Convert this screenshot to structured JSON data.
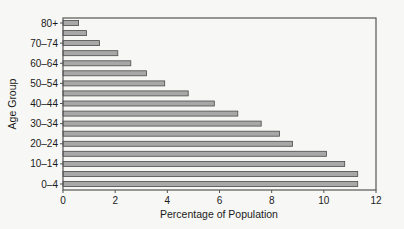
{
  "chart_data": {
    "type": "bar",
    "orientation": "horizontal",
    "title": "",
    "xlabel": "Percentage of Population",
    "ylabel": "Age Group",
    "xlim": [
      0,
      12
    ],
    "xticks": [
      0,
      2,
      4,
      6,
      8,
      10,
      12
    ],
    "grid": false,
    "legend": null,
    "categories": [
      "0–4",
      "5–9",
      "10–14",
      "15–19",
      "20–24",
      "25–29",
      "30–34",
      "35–39",
      "40–44",
      "45–49",
      "50–54",
      "55–59",
      "60–64",
      "65–69",
      "70–74",
      "75–79",
      "80+"
    ],
    "ytick_labels_shown": [
      "0–4",
      "10–14",
      "20–24",
      "30–34",
      "40–44",
      "50–54",
      "60–64",
      "70–74",
      "80+"
    ],
    "values": [
      11.3,
      11.3,
      10.8,
      10.1,
      8.8,
      8.3,
      7.6,
      6.7,
      5.8,
      4.8,
      3.9,
      3.2,
      2.6,
      2.1,
      1.4,
      0.9,
      0.6
    ],
    "colors": {
      "bar_fill": "#a8a8a8",
      "bar_stroke": "#4a4a4a",
      "axis": "#555555"
    }
  }
}
